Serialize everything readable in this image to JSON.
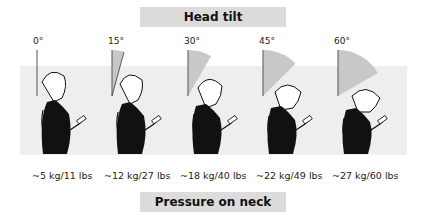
{
  "header": {
    "title": "Head tilt"
  },
  "footer": {
    "title": "Pressure on neck"
  },
  "colors": {
    "label_box_bg": "#dcdcdc",
    "band_bg": "#eeeeee",
    "wedge": "#c8c8c8",
    "line": "#555555",
    "figure_fill": "#111111"
  },
  "figures": [
    {
      "angle": "0°",
      "angle_deg": 0,
      "weight": "~5 kg/11 lbs",
      "x": 37
    },
    {
      "angle": "15°",
      "angle_deg": 15,
      "weight": "~12 kg/27 lbs",
      "x": 112
    },
    {
      "angle": "30°",
      "angle_deg": 30,
      "weight": "~18 kg/40 lbs",
      "x": 188
    },
    {
      "angle": "45°",
      "angle_deg": 45,
      "weight": "~22 kg/49 lbs",
      "x": 263
    },
    {
      "angle": "60°",
      "angle_deg": 60,
      "weight": "~27 kg/60 lbs",
      "x": 338
    }
  ]
}
